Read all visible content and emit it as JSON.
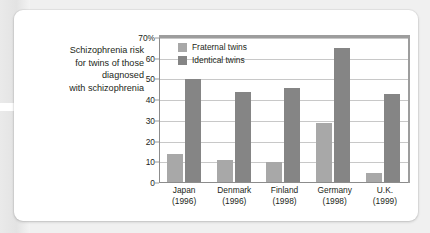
{
  "caption": {
    "line1": "Schizophrenia risk",
    "line2": "for twins of those",
    "line3": "diagnosed",
    "line4": "with schizophrenia"
  },
  "colors": {
    "fraternal": "#a8a8a8",
    "identical": "#858585",
    "grid": "#c8c8c8",
    "text": "#231f20",
    "card": "#ffffff",
    "background": "#f0f0f0"
  },
  "chart_data": {
    "type": "bar",
    "title": "",
    "subtitle": "",
    "xlabel": "",
    "ylabel": "",
    "ylim": [
      0,
      70
    ],
    "yticks": [
      0,
      10,
      20,
      30,
      40,
      50,
      60,
      70
    ],
    "ytick_labels": [
      "0",
      "10",
      "20",
      "30",
      "40",
      "50",
      "60",
      "70%"
    ],
    "grid": true,
    "legend_position": "top-left",
    "categories": [
      "Japan",
      "Denmark",
      "Finland",
      "Germany",
      "U.K."
    ],
    "category_years": [
      "(1996)",
      "(1996)",
      "(1998)",
      "(1998)",
      "(1999)"
    ],
    "series": [
      {
        "name": "Fraternal twins",
        "color": "#a8a8a8",
        "values": [
          14,
          11,
          10,
          29,
          5
        ]
      },
      {
        "name": "Identical twins",
        "color": "#858585",
        "values": [
          50,
          44,
          46,
          65,
          43
        ]
      }
    ]
  }
}
